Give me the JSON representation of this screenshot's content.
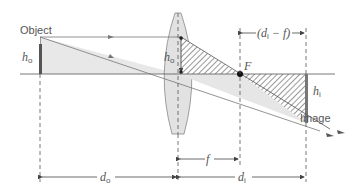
{
  "diagram": {
    "labels": {
      "object": "Object",
      "image": "Image",
      "focal_point": "F",
      "h_o_main": "h",
      "h_o_sub": "o",
      "h_o_lens_main": "h",
      "h_o_lens_sub": "o",
      "h_i_main": "h",
      "h_i_sub": "i",
      "d_o_main": "d",
      "d_o_sub": "o",
      "d_i_main": "d",
      "d_i_sub": "i",
      "f": "f",
      "di_minus_f_open": "(d",
      "di_minus_f_sub": "i",
      "di_minus_f_close": " − f)"
    },
    "colors": {
      "line": "#555555",
      "lens_fill": "#e4e4e4",
      "shade": "#e6e6e6",
      "hatch": "#555555",
      "object": "#555555"
    }
  }
}
